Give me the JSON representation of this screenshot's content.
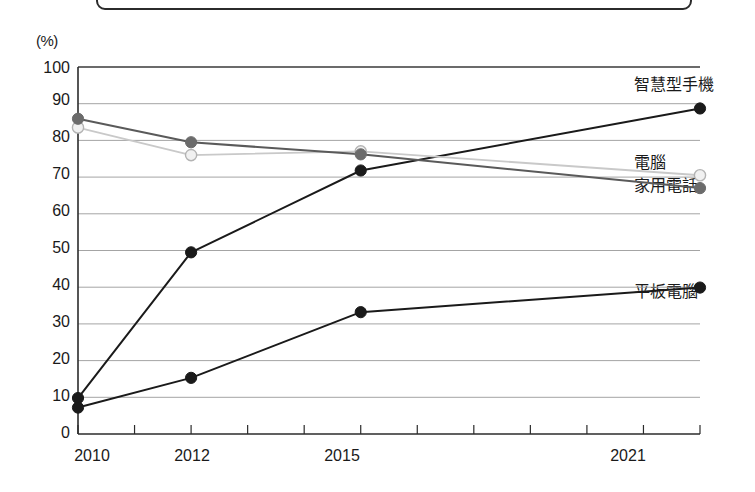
{
  "chart_data": {
    "type": "line",
    "title": "",
    "xlabel": "",
    "ylabel": "(%)",
    "unit_label": "(%)",
    "ylim": [
      0,
      100
    ],
    "ytick_step": 10,
    "yticks": [
      "100",
      "90",
      "80",
      "70",
      "60",
      "50",
      "40",
      "30",
      "20",
      "10",
      "0"
    ],
    "ytick_values": [
      100,
      90,
      80,
      70,
      60,
      50,
      40,
      30,
      20,
      10,
      0
    ],
    "x": [
      2010,
      2012,
      2015,
      2021
    ],
    "categories": [
      "2010",
      "2012",
      "2015",
      "2021"
    ],
    "xtick_years_all": [
      2010,
      2011,
      2012,
      2013,
      2014,
      2015,
      2016,
      2017,
      2018,
      2019,
      2020,
      2021
    ],
    "xtick_labels_shown": [
      "2010",
      "2012",
      "2015",
      "2021"
    ],
    "grid": true,
    "legend_position": "right-inline",
    "series": [
      {
        "name": "智慧型手機",
        "label": "智慧型手機",
        "values": [
          9.8,
          49.5,
          71.8,
          88.7
        ],
        "color": "#1a1a1a",
        "marker": "filled-circle",
        "marker_color": "#1a1a1a"
      },
      {
        "name": "電腦",
        "label": "電腦",
        "values": [
          83.5,
          76.0,
          77.0,
          70.5
        ],
        "color": "#c9c9c9",
        "marker": "open-circle",
        "marker_color": "#e3e3e3"
      },
      {
        "name": "家用電話",
        "label": "家用電話",
        "values": [
          85.9,
          79.5,
          76.2,
          67.0
        ],
        "color": "#5a5a5a",
        "marker": "filled-circle",
        "marker_color": "#6b6b6b"
      },
      {
        "name": "平板電腦",
        "label": "平板電腦",
        "values": [
          7.2,
          15.3,
          33.2,
          39.9
        ],
        "color": "#1a1a1a",
        "marker": "filled-circle",
        "marker_color": "#1a1a1a"
      }
    ],
    "annotations": [
      {
        "text": "智慧型手機",
        "x": 2021,
        "y": 92.5
      },
      {
        "text": "電腦",
        "x": 2021,
        "y": 73.5
      },
      {
        "text": "家用電話",
        "x": 2021,
        "y": 66.5
      },
      {
        "text": "平板電腦",
        "x": 2021,
        "y": 38.5
      }
    ]
  }
}
